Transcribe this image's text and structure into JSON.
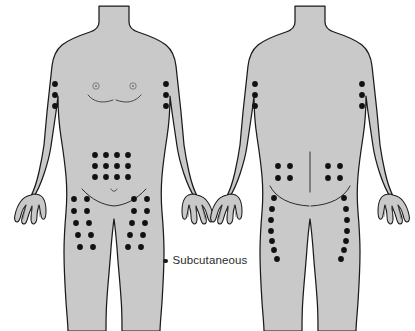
{
  "figure": {
    "background_color": "#ffffff",
    "body_fill_color": "#c9c9c9",
    "body_outline_color": "#1a1a1a",
    "dot_color": "#111111",
    "width": 415,
    "height": 331
  },
  "legend": {
    "marker": "filled-dot",
    "label": "Subcutaneous",
    "marker_color": "#1a1a1a"
  },
  "views": [
    {
      "name": "anterior-view",
      "label": "Front of body",
      "sites": [
        {
          "region": "left-upper-arm",
          "label": "Left upper arm",
          "pattern": "vertical-column",
          "columns": 1,
          "rows": 3,
          "count": 3,
          "points": [
            [
              55,
              84
            ],
            [
              55,
              95
            ],
            [
              55,
              106
            ]
          ]
        },
        {
          "region": "right-upper-arm",
          "label": "Right upper arm",
          "pattern": "vertical-column",
          "columns": 1,
          "rows": 3,
          "count": 3,
          "points": [
            [
              166,
              84
            ],
            [
              166,
              95
            ],
            [
              166,
              106
            ]
          ]
        },
        {
          "region": "abdomen",
          "label": "Abdomen",
          "pattern": "grid",
          "columns": 4,
          "rows": 3,
          "count": 12,
          "points": [
            [
              95,
              155
            ],
            [
              106,
              155
            ],
            [
              117,
              155
            ],
            [
              128,
              155
            ],
            [
              95,
              166
            ],
            [
              106,
              166
            ],
            [
              117,
              166
            ],
            [
              128,
              166
            ],
            [
              95,
              177
            ],
            [
              106,
              177
            ],
            [
              117,
              177
            ],
            [
              128,
              177
            ]
          ]
        },
        {
          "region": "left-anterior-thigh",
          "label": "Left anterior thigh",
          "pattern": "grid",
          "columns": 2,
          "rows": 5,
          "count": 10,
          "points": [
            [
              74,
              199
            ],
            [
              87,
              199
            ],
            [
              74,
              211
            ],
            [
              87,
              211
            ],
            [
              76,
              223
            ],
            [
              89,
              223
            ],
            [
              78,
              235
            ],
            [
              91,
              235
            ],
            [
              80,
              247
            ],
            [
              93,
              247
            ]
          ]
        },
        {
          "region": "right-anterior-thigh",
          "label": "Right anterior thigh",
          "pattern": "grid",
          "columns": 2,
          "rows": 5,
          "count": 10,
          "points": [
            [
              134,
              199
            ],
            [
              147,
              199
            ],
            [
              134,
              211
            ],
            [
              147,
              211
            ],
            [
              132,
              223
            ],
            [
              145,
              223
            ],
            [
              130,
              235
            ],
            [
              143,
              235
            ],
            [
              128,
              247
            ],
            [
              141,
              247
            ]
          ]
        }
      ],
      "anatomy_marks": [
        {
          "name": "left-nipple",
          "type": "small-circle",
          "point": [
            96,
            86
          ]
        },
        {
          "name": "right-nipple",
          "type": "small-circle",
          "point": [
            133,
            86
          ]
        },
        {
          "name": "breast-fold-left",
          "type": "curve"
        },
        {
          "name": "breast-fold-right",
          "type": "curve"
        },
        {
          "name": "navel",
          "type": "small-arc",
          "point": [
            114,
            190
          ]
        },
        {
          "name": "groin-crease",
          "type": "curve"
        }
      ]
    },
    {
      "name": "posterior-view",
      "label": "Back of body",
      "sites": [
        {
          "region": "left-posterior-upper-arm",
          "label": "Left posterior upper arm",
          "pattern": "vertical-column",
          "columns": 1,
          "rows": 3,
          "count": 3,
          "points": [
            [
              255,
              84
            ],
            [
              255,
              95
            ],
            [
              255,
              106
            ]
          ]
        },
        {
          "region": "right-posterior-upper-arm",
          "label": "Right posterior upper arm",
          "pattern": "vertical-column",
          "columns": 1,
          "rows": 3,
          "count": 3,
          "points": [
            [
              362,
              84
            ],
            [
              362,
              95
            ],
            [
              362,
              106
            ]
          ]
        },
        {
          "region": "left-buttock",
          "label": "Left buttock",
          "pattern": "grid",
          "columns": 2,
          "rows": 2,
          "count": 4,
          "points": [
            [
              278,
              166
            ],
            [
              290,
              166
            ],
            [
              278,
              178
            ],
            [
              290,
              178
            ]
          ]
        },
        {
          "region": "right-buttock",
          "label": "Right buttock",
          "pattern": "grid",
          "columns": 2,
          "rows": 2,
          "count": 4,
          "points": [
            [
              328,
              166
            ],
            [
              340,
              166
            ],
            [
              328,
              178
            ],
            [
              340,
              178
            ]
          ]
        },
        {
          "region": "left-posterior-thigh",
          "label": "Left posterior thigh",
          "pattern": "curved-column",
          "columns": 1,
          "rows": 7,
          "count": 7,
          "points": [
            [
              274,
              198
            ],
            [
              272,
              209
            ],
            [
              271,
              220
            ],
            [
              271,
              231
            ],
            [
              272,
              241
            ],
            [
              274,
              250
            ],
            [
              277,
              259
            ]
          ]
        },
        {
          "region": "right-posterior-thigh",
          "label": "Right posterior thigh",
          "pattern": "curved-column",
          "columns": 1,
          "rows": 7,
          "count": 7,
          "points": [
            [
              344,
              198
            ],
            [
              346,
              209
            ],
            [
              347,
              220
            ],
            [
              347,
              231
            ],
            [
              346,
              241
            ],
            [
              344,
              250
            ],
            [
              341,
              259
            ]
          ]
        }
      ],
      "anatomy_marks": [
        {
          "name": "spine-line",
          "type": "line"
        },
        {
          "name": "gluteal-cleft",
          "type": "line"
        },
        {
          "name": "gluteal-fold-left",
          "type": "curve"
        },
        {
          "name": "gluteal-fold-right",
          "type": "curve"
        }
      ]
    }
  ]
}
